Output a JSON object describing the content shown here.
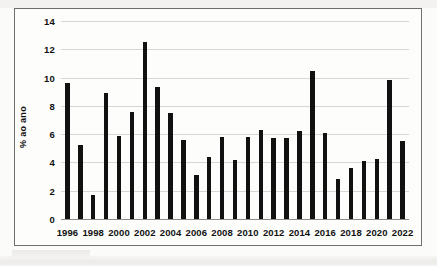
{
  "chart_data": {
    "type": "bar",
    "title": "",
    "subtitle": "",
    "xlabel": "",
    "ylabel": "% ao ano",
    "ylim": [
      0,
      14
    ],
    "yticks": [
      0,
      2,
      4,
      6,
      8,
      10,
      12,
      14
    ],
    "ytick_labels": [
      "0",
      "2",
      "4",
      "6",
      "8",
      "10",
      "12",
      "14"
    ],
    "grid": true,
    "legend": null,
    "bar_color": "#111111",
    "grid_color": "#d7d7d4",
    "categories": [
      "1996",
      "1997",
      "1998",
      "1999",
      "2000",
      "2001",
      "2002",
      "2003",
      "2004",
      "2005",
      "2006",
      "2007",
      "2008",
      "2009",
      "2010",
      "2011",
      "2012",
      "2013",
      "2014",
      "2015",
      "2016",
      "2017",
      "2018",
      "2019",
      "2020",
      "2021",
      "2022"
    ],
    "values": [
      9.6,
      5.2,
      1.7,
      8.9,
      5.9,
      7.6,
      12.5,
      9.3,
      7.5,
      5.6,
      3.1,
      4.4,
      5.8,
      4.2,
      5.8,
      6.3,
      5.7,
      5.7,
      6.2,
      10.45,
      6.05,
      2.8,
      3.6,
      4.1,
      4.25,
      9.85,
      5.5
    ],
    "xtick_labels": [
      "1996",
      "1998",
      "2000",
      "2002",
      "2004",
      "2006",
      "2008",
      "2010",
      "2012",
      "2014",
      "2016",
      "2018",
      "2020",
      "2022"
    ],
    "xtick_categories": [
      "1996",
      "1998",
      "2000",
      "2002",
      "2004",
      "2006",
      "2008",
      "2010",
      "2012",
      "2014",
      "2016",
      "2018",
      "2020",
      "2022"
    ]
  }
}
